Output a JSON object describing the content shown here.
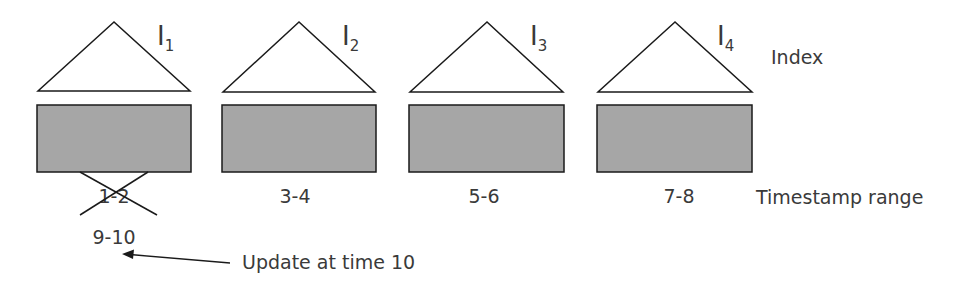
{
  "diagram": {
    "colors": {
      "block_fill": "#a6a6a6",
      "stroke": "#1a1a1a",
      "text": "#3a3a3a"
    },
    "legend": {
      "index_label": "Index",
      "range_label": "Timestamp range"
    },
    "partitions": [
      {
        "index_letter": "I",
        "index_subscript": "1",
        "range": "1-2",
        "crossed_out": true,
        "new_range": "9-10"
      },
      {
        "index_letter": "I",
        "index_subscript": "2",
        "range": "3-4",
        "crossed_out": false
      },
      {
        "index_letter": "I",
        "index_subscript": "3",
        "range": "5-6",
        "crossed_out": false
      },
      {
        "index_letter": "I",
        "index_subscript": "4",
        "range": "7-8",
        "crossed_out": false
      }
    ],
    "annotation": {
      "text": "Update at time 10",
      "arrow_icon": "arrow-left-icon"
    }
  }
}
